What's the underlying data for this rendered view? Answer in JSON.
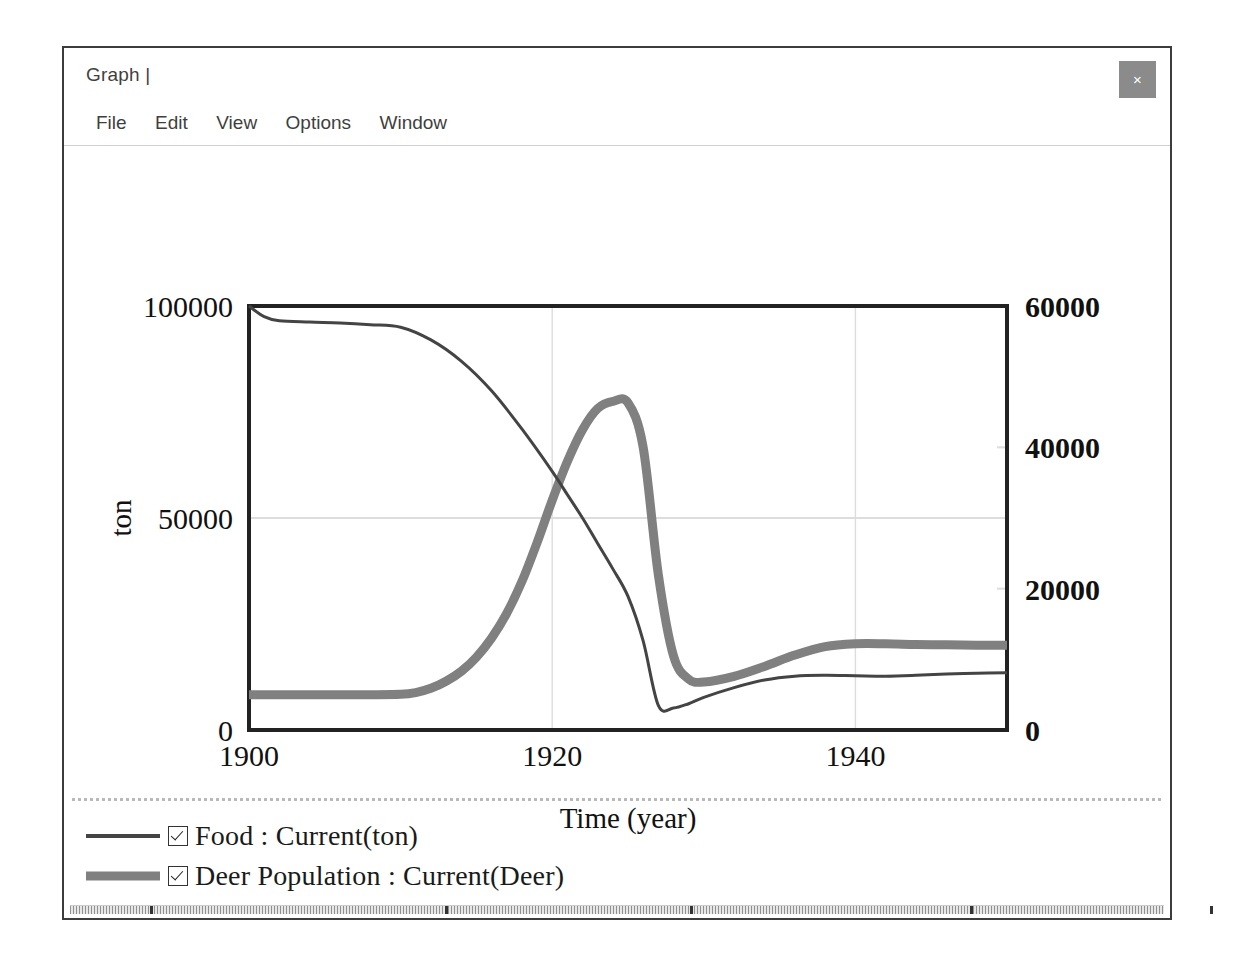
{
  "window": {
    "title": "Graph |",
    "close_label": "×",
    "menu": [
      "File",
      "Edit",
      "View",
      "Options",
      "Window"
    ]
  },
  "colors": {
    "food_line": "#444444",
    "deer_line": "#808080",
    "axis": "#222222",
    "gridline": "#dddddd",
    "title_bar_text": "#3f3f3f",
    "close_button_bg": "#8b8b8b",
    "window_border": "#3c3c3c",
    "background": "#ffffff"
  },
  "chart_data": {
    "type": "line",
    "title": "",
    "xlabel": "Time (year)",
    "ylabel": "ton",
    "y2label": "Deer",
    "xlim": [
      1900,
      1950
    ],
    "ylim": [
      0,
      100000
    ],
    "y2lim": [
      0,
      60000
    ],
    "xticks": [
      1900,
      1920,
      1940
    ],
    "xticklabels": [
      "1900",
      "1920",
      "1940"
    ],
    "yticks": [
      0,
      50000,
      100000
    ],
    "yticklabels": [
      "0",
      "50000",
      "100000"
    ],
    "y2ticks": [
      0,
      20000,
      40000,
      60000
    ],
    "y2ticklabels": [
      "0",
      "20000",
      "40000",
      "60000"
    ],
    "grid": true,
    "legend_position": "below-plot",
    "series": [
      {
        "name": "Food : Current(ton)",
        "axis": "left",
        "unit": "ton",
        "color": "#444444",
        "width": 3,
        "checked": true,
        "x": [
          1900,
          1901,
          1902,
          1904,
          1906,
          1908,
          1910,
          1912,
          1914,
          1916,
          1918,
          1920,
          1921,
          1922,
          1923,
          1924,
          1925,
          1926,
          1927,
          1928,
          1929,
          1930,
          1932,
          1934,
          1936,
          1938,
          1940,
          1942,
          1944,
          1946,
          1948,
          1950
        ],
        "y": [
          100000,
          97500,
          96500,
          96200,
          96000,
          95600,
          95000,
          92000,
          87000,
          80000,
          71000,
          61000,
          55500,
          50000,
          44000,
          38000,
          31500,
          21000,
          5800,
          5200,
          6200,
          7700,
          10000,
          11800,
          12700,
          12900,
          12800,
          12700,
          12900,
          13200,
          13400,
          13500
        ]
      },
      {
        "name": "Deer Population : Current(Deer)",
        "axis": "right",
        "unit": "Deer",
        "color": "#808080",
        "width": 9,
        "checked": true,
        "x": [
          1900,
          1902,
          1904,
          1906,
          1908,
          1910,
          1911,
          1912,
          1913,
          1914,
          1915,
          1916,
          1917,
          1918,
          1919,
          1920,
          1921,
          1922,
          1923,
          1924,
          1925,
          1926,
          1927,
          1928,
          1929,
          1930,
          1932,
          1934,
          1936,
          1938,
          1940,
          1942,
          1944,
          1946,
          1948,
          1950
        ],
        "y": [
          5000,
          5000,
          5000,
          5000,
          5000,
          5050,
          5300,
          5900,
          6900,
          8300,
          10300,
          13000,
          16500,
          21000,
          26500,
          32500,
          38000,
          42500,
          45500,
          46500,
          46300,
          40000,
          22000,
          10500,
          7200,
          6800,
          7600,
          9000,
          10600,
          11800,
          12200,
          12200,
          12100,
          12050,
          12000,
          12000
        ]
      }
    ]
  },
  "legend": {
    "rows": [
      {
        "label": "Food : Current(ton)"
      },
      {
        "label": "Deer Population : Current(Deer)"
      }
    ]
  }
}
